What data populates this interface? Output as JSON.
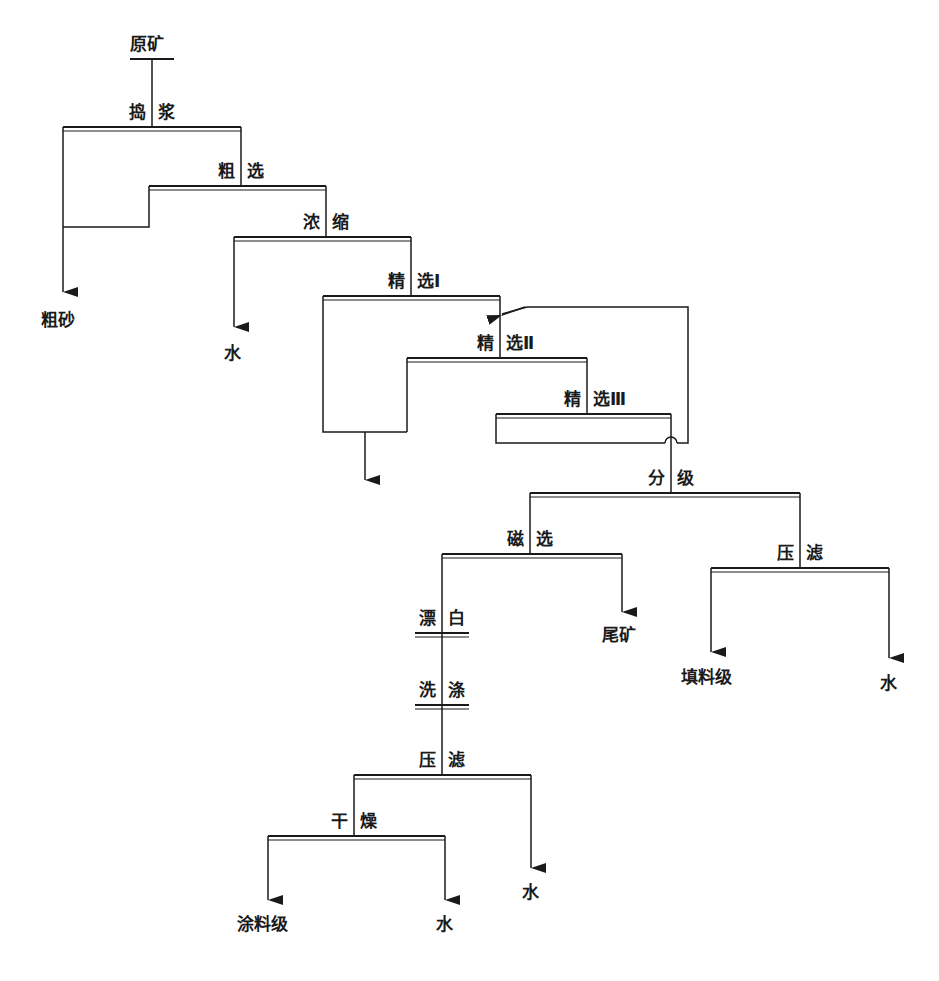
{
  "diagram": {
    "type": "flowchart",
    "title": "",
    "nodes": {
      "raw_ore": "原矿",
      "slurry_left": "捣",
      "slurry_right": "浆",
      "rough_left": "粗",
      "rough_right": "选",
      "thicken_left": "浓",
      "thicken_right": "缩",
      "clean1_left": "精",
      "clean1_right": "选Ⅰ",
      "clean2_left": "精",
      "clean2_right": "选Ⅱ",
      "clean3_left": "精",
      "clean3_right": "选Ⅲ",
      "classify_left": "分",
      "classify_right": "级",
      "magsep_left": "磁",
      "magsep_right": "选",
      "press1_left": "压",
      "press1_right": "滤",
      "bleach_left": "漂",
      "bleach_right": "白",
      "wash_left": "洗",
      "wash_right": "涤",
      "press2_left": "压",
      "press2_right": "滤",
      "dry_left": "干",
      "dry_right": "燥"
    },
    "outputs": {
      "coarse_sand": "粗砂",
      "water1": "水",
      "tailings": "尾矿",
      "filler_grade": "填料级",
      "water2": "水",
      "water3": "水",
      "coating_grade": "涂料级",
      "water4": "水"
    },
    "flow": [
      {
        "from": "原矿",
        "to": "捣浆"
      },
      {
        "from": "捣浆",
        "to": "粗砂"
      },
      {
        "from": "捣浆",
        "to": "粗选"
      },
      {
        "from": "粗选",
        "to": "粗砂"
      },
      {
        "from": "粗选",
        "to": "浓缩"
      },
      {
        "from": "浓缩",
        "to": "水"
      },
      {
        "from": "浓缩",
        "to": "精选Ⅰ"
      },
      {
        "from": "精选Ⅰ",
        "to": "精选Ⅱ"
      },
      {
        "from": "精选Ⅰ",
        "to": "tailings (unlabeled arrow)"
      },
      {
        "from": "精选Ⅱ",
        "to": "精选Ⅲ"
      },
      {
        "from": "精选Ⅱ",
        "to": "tailings (unlabeled arrow)"
      },
      {
        "from": "精选Ⅲ",
        "to": "精选Ⅰ (recycle)"
      },
      {
        "from": "精选Ⅲ",
        "to": "分级"
      },
      {
        "from": "分级",
        "to": "磁选"
      },
      {
        "from": "分级",
        "to": "压滤"
      },
      {
        "from": "压滤",
        "to": "填料级"
      },
      {
        "from": "压滤",
        "to": "水"
      },
      {
        "from": "磁选",
        "to": "漂白"
      },
      {
        "from": "磁选",
        "to": "尾矿"
      },
      {
        "from": "漂白",
        "to": "洗涤"
      },
      {
        "from": "洗涤",
        "to": "压滤"
      },
      {
        "from": "压滤",
        "to": "干燥"
      },
      {
        "from": "压滤",
        "to": "水"
      },
      {
        "from": "干燥",
        "to": "涂料级"
      },
      {
        "from": "干燥",
        "to": "水"
      }
    ]
  }
}
